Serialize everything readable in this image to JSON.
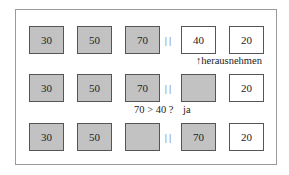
{
  "diagram": {
    "colors": {
      "filled": "#c2c2c2",
      "empty": "#ffffff",
      "border": "#555555",
      "frame": "#9a9a9a"
    },
    "separator": "||",
    "rows": [
      {
        "boxes": [
          {
            "value": "30",
            "fill": "gray"
          },
          {
            "value": "50",
            "fill": "gray"
          },
          {
            "value": "70",
            "fill": "gray"
          },
          {
            "value": "40",
            "fill": "white"
          },
          {
            "value": "20",
            "fill": "white"
          }
        ],
        "annotation": "↑herausnehmen"
      },
      {
        "boxes": [
          {
            "value": "30",
            "fill": "gray"
          },
          {
            "value": "50",
            "fill": "gray"
          },
          {
            "value": "70",
            "fill": "gray"
          },
          {
            "value": "",
            "fill": "gray"
          },
          {
            "value": "20",
            "fill": "white"
          }
        ],
        "annotation": "70 > 40 ?",
        "answer": "ja"
      },
      {
        "boxes": [
          {
            "value": "30",
            "fill": "gray"
          },
          {
            "value": "50",
            "fill": "gray"
          },
          {
            "value": "",
            "fill": "gray"
          },
          {
            "value": "70",
            "fill": "gray"
          },
          {
            "value": "20",
            "fill": "white"
          }
        ]
      }
    ]
  }
}
